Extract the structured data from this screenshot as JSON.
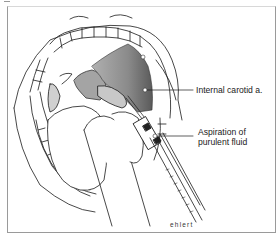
{
  "figure": {
    "labels": [
      {
        "text": "Internal carotid a.",
        "anchor": "internal-carotid-artery"
      },
      {
        "text_line1": "Aspiration of",
        "text_line2": "purulent fluid",
        "anchor": "needle-tip"
      }
    ],
    "signature": "ehlert",
    "colors": {
      "line": "#1a1a1a",
      "shade_dark": "#6e6e6e",
      "shade_mid": "#a0a0a0",
      "frame": "#9a9a9a"
    }
  }
}
